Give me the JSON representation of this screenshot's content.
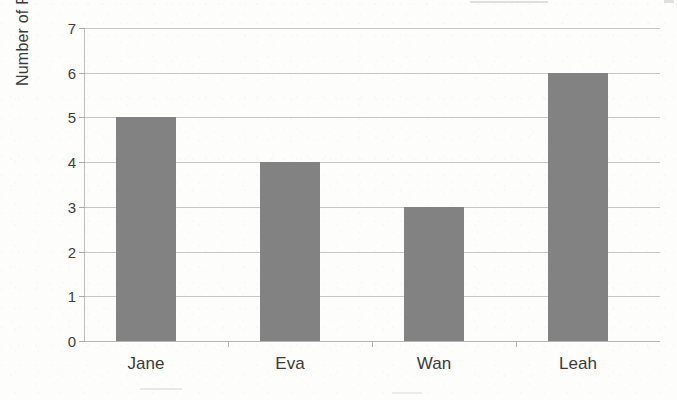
{
  "chart_data": {
    "type": "bar",
    "title": "",
    "xlabel": "",
    "ylabel": "Number of Pets",
    "categories": [
      "Jane",
      "Eva",
      "Wan",
      "Leah"
    ],
    "values": [
      5,
      4,
      3,
      6
    ],
    "ylim": [
      0,
      7
    ],
    "y_ticks": [
      0,
      1,
      2,
      3,
      4,
      5,
      6,
      7
    ],
    "y_tick_labels": [
      "0",
      "1",
      "2",
      "3",
      "4",
      "5",
      "6",
      "7"
    ],
    "grid": "horizontal",
    "legend": "none",
    "bar_color": "#828282",
    "gridline_color": "#c6c6c6",
    "axis_color": "#bdbdbd",
    "text_color": "#3a3a3a",
    "background_color": "#fdfdfc"
  },
  "axes": {
    "y_title": "Number of Pets"
  }
}
